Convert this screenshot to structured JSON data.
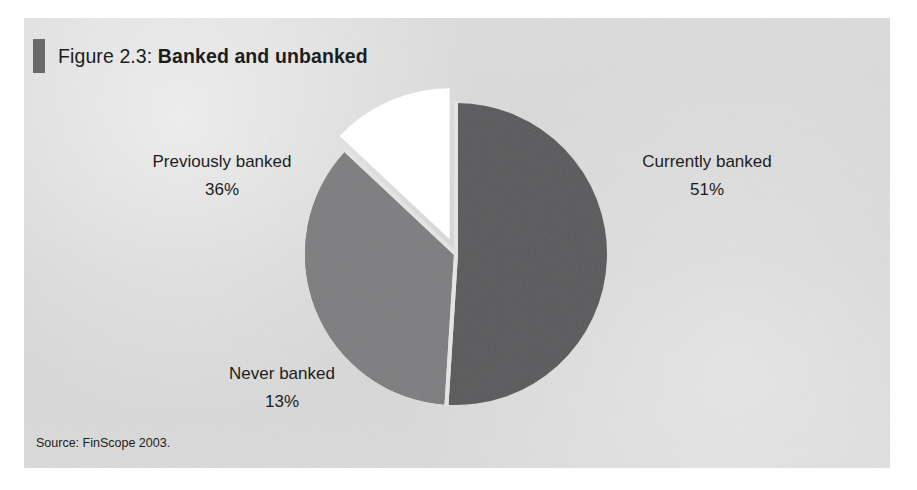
{
  "figure": {
    "label": "Figure 2.3:",
    "name": "Banked and unbanked",
    "marker_color": "#6a6a6c",
    "panel_color": "#d9d9d9",
    "source": "Source: FinScope 2003."
  },
  "chart_data": {
    "type": "pie",
    "title": "Figure 2.3: Banked and unbanked",
    "categories": [
      "Currently banked",
      "Previously banked",
      "Never banked"
    ],
    "values": [
      51,
      36,
      13
    ],
    "value_labels": [
      "51%",
      "36%",
      "13%"
    ],
    "units": "percent",
    "start_angle": 0,
    "direction": "clockwise",
    "legend": "none",
    "labels_position": "outside-callout",
    "slices": [
      {
        "name": "Currently banked",
        "value": 51,
        "value_label": "51%",
        "color": "#58585a",
        "exploded": false,
        "label_side": "right"
      },
      {
        "name": "Previously banked",
        "value": 36,
        "value_label": "36%",
        "color": "#7c7c7e",
        "exploded": false,
        "label_side": "left"
      },
      {
        "name": "Never banked",
        "value": 13,
        "value_label": "13%",
        "color": "#ffffff",
        "exploded": true,
        "label_side": "bottom-left"
      }
    ],
    "xlabel": "",
    "ylabel": "",
    "grid": false,
    "source": "Source: FinScope 2003."
  }
}
